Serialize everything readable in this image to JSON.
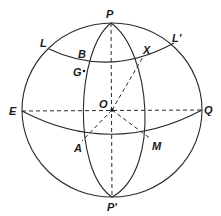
{
  "diagram": {
    "colors": {
      "stroke": "#2a2a2a",
      "text": "#1a1a1a",
      "background": "#ffffff"
    },
    "labels": {
      "P": "P",
      "P_prime": "P'",
      "E": "E",
      "Q": "Q",
      "O": "O",
      "L": "L",
      "L_prime": "L'",
      "B": "B",
      "X": "X",
      "G": "G",
      "A": "A",
      "M": "M"
    }
  }
}
